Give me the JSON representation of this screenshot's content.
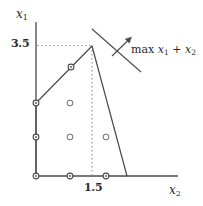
{
  "figure": {
    "width": 203,
    "height": 206,
    "background": "#ffffff",
    "ink_color": "#3a3a3a",
    "dotted_color": "#9a9a9a"
  },
  "axes": {
    "y_axis": {
      "label": "x",
      "subscript": "1",
      "x": 36,
      "y_top": 22,
      "y_bottom": 176
    },
    "x_axis": {
      "label": "x",
      "subscript": "2",
      "y": 176,
      "x_left": 36,
      "x_right": 178
    },
    "ticks": [
      {
        "name": "y-tick-3.5",
        "axis": "y",
        "value": "3.5",
        "pixel_x": 36,
        "pixel_y": 46
      },
      {
        "name": "x-tick-1.5",
        "axis": "x",
        "value": "1.5",
        "pixel_x": 92,
        "pixel_y": 176
      }
    ]
  },
  "objective": {
    "text_prefix": "max",
    "term1": "x",
    "term1_sub": "1",
    "plus": "+",
    "term2": "x",
    "term2_sub": "2",
    "full_text": "max x1 + x2",
    "level_line": {
      "x1": 92,
      "y1": 29,
      "x2": 141,
      "y2": 72
    },
    "arrow": {
      "x1": 112,
      "y1": 56,
      "x2": 132,
      "y2": 37
    }
  },
  "polygon": {
    "name": "feasible-region",
    "vertices": [
      {
        "x": 36,
        "y": 176
      },
      {
        "x": 36,
        "y": 103
      },
      {
        "x": 92,
        "y": 46
      },
      {
        "x": 127,
        "y": 176
      }
    ]
  },
  "guides": {
    "horizontal_dotted": {
      "x1": 37,
      "y1": 46,
      "x2": 92,
      "y2": 46
    },
    "vertical_dotted": {
      "x1": 92,
      "y1": 46,
      "x2": 92,
      "y2": 176
    }
  },
  "lattice_points": [
    {
      "name": "lattice-point-origin",
      "x": 36,
      "y": 176,
      "style": "boundary"
    },
    {
      "name": "lattice-point-1-0",
      "x": 70,
      "y": 176,
      "style": "boundary"
    },
    {
      "name": "lattice-point-2-0",
      "x": 106,
      "y": 176,
      "style": "boundary"
    },
    {
      "name": "lattice-point-0-1",
      "x": 36,
      "y": 137,
      "style": "boundary"
    },
    {
      "name": "lattice-point-1-1",
      "x": 70,
      "y": 137,
      "style": "interior"
    },
    {
      "name": "lattice-point-2-1",
      "x": 106,
      "y": 137,
      "style": "interior"
    },
    {
      "name": "lattice-point-0-2",
      "x": 36,
      "y": 103,
      "style": "boundary"
    },
    {
      "name": "lattice-point-1-2",
      "x": 70,
      "y": 103,
      "style": "interior"
    },
    {
      "name": "lattice-point-1-3",
      "x": 71,
      "y": 67,
      "style": "boundary"
    }
  ]
}
